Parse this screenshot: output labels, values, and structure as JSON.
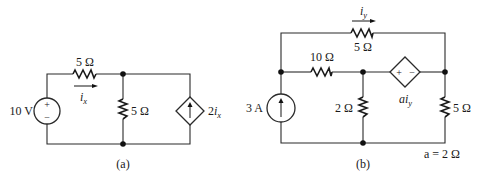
{
  "figure": {
    "a": {
      "caption": "(a)",
      "source_voltage": "10 V",
      "source_plus": "+",
      "source_minus": "−",
      "r_series": "5 Ω",
      "r_shunt": "5 Ω",
      "current_var": "i",
      "current_sub": "x",
      "dep_source_coef": "2",
      "dep_source_var": "i",
      "dep_source_sub": "x"
    },
    "b": {
      "caption": "(b)",
      "current_source": "3 A",
      "r_top": "5 Ω",
      "r_10": "10 Ω",
      "r_2": "2 Ω",
      "r_right": "5 Ω",
      "current_var": "i",
      "current_sub": "y",
      "dep_plus": "+",
      "dep_minus": "−",
      "dep_coef": "a",
      "dep_var": "i",
      "dep_sub": "y",
      "param_note": "a = 2 Ω"
    }
  },
  "colors": {
    "ink": "#1a1a1a",
    "background": "#ffffff"
  }
}
